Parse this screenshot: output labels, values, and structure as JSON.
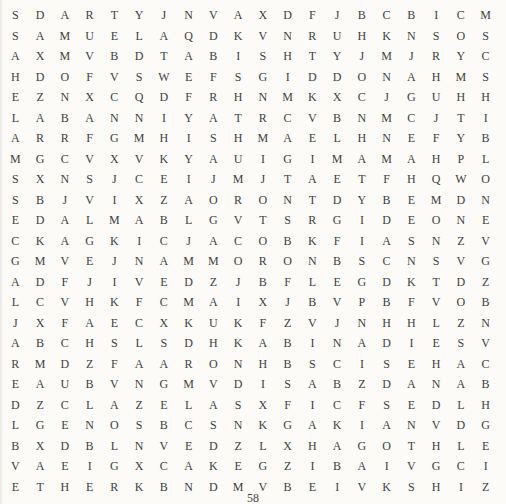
{
  "page": {
    "background": "#fcfbf8",
    "letter_color": "#413f3d",
    "page_number": "58"
  },
  "puzzle": {
    "type": "word-search",
    "columns": 20,
    "rows": 24,
    "grid": [
      "SDARTYJNVAXDFJBCBICM",
      "SAMUELAQDKVNRUHKNSOS",
      "AXMVBDTABISHTYJMJRYC",
      "HDOFVSWEFSGIDDONAHMS",
      "EZNXCQDFRHNMKXCJGUHH",
      "LABANNIYATRCVBNMCJTI",
      "ARRFGMHISHMAELHNEFYB",
      "MGCVXVKYAUIGIMAMAHPL",
      "SXNSJCEIJMJTAETFHQWO",
      "SBJVIXZAORONTDYBEMDN",
      "EDALMABLGVTSRGIDEONE",
      "CKAGKICJACOBKFIASNZV",
      "GMVEJNAMMORONBSCNSVG",
      "ADFJIVEDZJBFLEGDKTDZ",
      "LCVHKFCMAIXJBVPBFVOB",
      "JXFAECXKUKFZVJNHHLZN",
      "ABCHSLSDHKABINADIESV",
      "RMDZFAARONHBSCISEHAC",
      "EAUBVNGMVDISABZDANAB",
      "DZCLAZELASXFICFSEDLH",
      "LGENOSBCSNKGAKIANVDG",
      "BXDBLNVEDZLXHAGOTHLE",
      "VAEIGXCAKEGZIBAIVGCI",
      "ETHERKBNDMVBEIVKSHIZ"
    ]
  }
}
